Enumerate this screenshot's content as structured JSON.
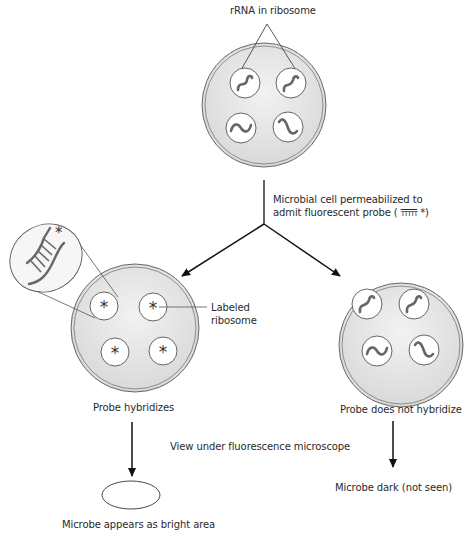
{
  "labels": {
    "rrna_in_ribosome": "rRNA in ribosome",
    "permeabilized_line1": "Microbial cell permeabilized to",
    "permeabilized_line2": "admit fluorescent probe (",
    "probe_glyph": "ΤΤΤΤΤ",
    "probe_star": "*)",
    "labeled_ribosome_line1": "Labeled",
    "labeled_ribosome_line2": "ribosome",
    "probe_hybridizes": "Probe hybridizes",
    "probe_does_not_hybridize": "Probe does not hybridize",
    "view_under_microscope": "View under fluorescence microscope",
    "microbe_bright": "Microbe appears as bright area",
    "microbe_dark": "Microbe dark (not seen)"
  },
  "colors": {
    "cell_fill": "#e4e4e4",
    "outline": "#555555",
    "rrna": "#666666",
    "arrow": "#111111"
  }
}
